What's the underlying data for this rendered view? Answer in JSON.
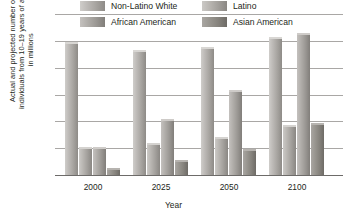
{
  "chart_data": {
    "type": "bar",
    "title": "",
    "xlabel": "Year",
    "ylabel": "Actual and projected number of\nindividuals from 10–19 years of age\nin millions",
    "categories": [
      "2000",
      "2025",
      "2050",
      "2100"
    ],
    "series": [
      {
        "name": "Non-Latino White",
        "color": "#b0adaa",
        "values": [
          24.4,
          23.0,
          23.5,
          25.3
        ]
      },
      {
        "name": "Latino",
        "color": "#aeaba8",
        "values": [
          4.8,
          5.5,
          6.8,
          9.0
        ]
      },
      {
        "name": "African American",
        "color": "#a5a29e",
        "values": [
          4.8,
          10.0,
          15.5,
          26.1
        ]
      },
      {
        "name": "Asian American",
        "color": "#8a8782",
        "values": [
          1.0,
          2.5,
          4.5,
          9.4
        ]
      }
    ],
    "ylim": [
      0,
      30
    ],
    "yticks": [
      "30",
      "25",
      "20",
      "15",
      "10",
      "5",
      "0"
    ],
    "ytick_values": [
      30,
      25,
      20,
      15,
      10,
      5,
      0
    ],
    "grid": true,
    "legend_position": "top"
  },
  "legend": {
    "items": [
      {
        "label": "Non-Latino White"
      },
      {
        "label": "Latino"
      },
      {
        "label": "African American"
      },
      {
        "label": "Asian American"
      }
    ]
  }
}
